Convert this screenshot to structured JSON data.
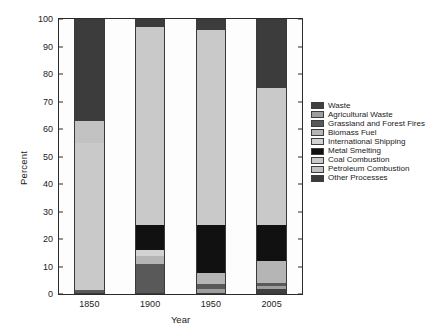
{
  "chart_data": {
    "type": "bar",
    "stacked": true,
    "title": "",
    "xlabel": "Year",
    "ylabel": "Percent",
    "categories": [
      "1850",
      "1900",
      "1950",
      "2005"
    ],
    "ylim": [
      0,
      100
    ],
    "yticks": [
      0,
      10,
      20,
      30,
      40,
      50,
      60,
      70,
      80,
      90,
      100
    ],
    "grid": false,
    "legend_position": "right",
    "series": [
      {
        "name": "Waste",
        "color": "#404040",
        "values": [
          0.0,
          0.0,
          0.0,
          2.0
        ]
      },
      {
        "name": "Agricultural Waste",
        "color": "#9e9e9e",
        "values": [
          0.0,
          0.0,
          2.0,
          1.0
        ]
      },
      {
        "name": "Grassland and Forest Fires",
        "color": "#595959",
        "values": [
          1.5,
          11.0,
          1.5,
          1.0
        ]
      },
      {
        "name": "Biomass Fuel",
        "color": "#b5b5b5",
        "values": [
          0.0,
          3.0,
          4.0,
          8.0
        ]
      },
      {
        "name": "International Shipping",
        "color": "#d2d2d2",
        "values": [
          0.0,
          2.0,
          0.0,
          0.0
        ]
      },
      {
        "name": "Metal Smelting",
        "color": "#111111",
        "values": [
          0.0,
          9.0,
          17.5,
          13.0
        ]
      },
      {
        "name": "Coal Combustion",
        "color": "#c9c9c9",
        "values": [
          53.5,
          72.0,
          71.0,
          50.0
        ]
      },
      {
        "name": "Petroleum Combustion",
        "color": "#c2c2c2",
        "values": [
          8.0,
          0.0,
          0.0,
          0.0
        ]
      },
      {
        "name": "Other Processes",
        "color": "#3c3c3c",
        "values": [
          37.0,
          3.0,
          4.0,
          25.0
        ]
      }
    ],
    "stack_order_bottom_to_top": [
      "Waste",
      "Agricultural Waste",
      "Grassland and Forest Fires",
      "Biomass Fuel",
      "International Shipping",
      "Metal Smelting",
      "Coal Combustion",
      "Petroleum Combustion",
      "Other Processes"
    ]
  },
  "legend": {
    "items": [
      {
        "label": "Waste",
        "color": "#404040"
      },
      {
        "label": "Agricultural Waste",
        "color": "#9e9e9e"
      },
      {
        "label": "Grassland and Forest Fires",
        "color": "#595959"
      },
      {
        "label": "Biomass Fuel",
        "color": "#b5b5b5"
      },
      {
        "label": "International Shipping",
        "color": "#d2d2d2"
      },
      {
        "label": "Metal Smelting",
        "color": "#111111"
      },
      {
        "label": "Coal Combustion",
        "color": "#c9c9c9"
      },
      {
        "label": "Petroleum Combustion",
        "color": "#c2c2c2"
      },
      {
        "label": "Other Processes",
        "color": "#3c3c3c"
      }
    ]
  }
}
